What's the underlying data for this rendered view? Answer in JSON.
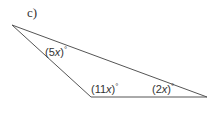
{
  "part_label": "c)",
  "triangle": {
    "vertices": {
      "top_left": [
        12,
        25
      ],
      "bottom_middle": [
        91,
        97
      ],
      "bottom_right": [
        207,
        97
      ]
    },
    "stroke_color": "#555555"
  },
  "angles": {
    "top_left": {
      "coef": "5",
      "var": "x",
      "unit": "°"
    },
    "bottom_middle": {
      "coef": "11",
      "var": "x",
      "unit": "°"
    },
    "bottom_right": {
      "coef": "2",
      "var": "x",
      "unit": "°"
    }
  }
}
